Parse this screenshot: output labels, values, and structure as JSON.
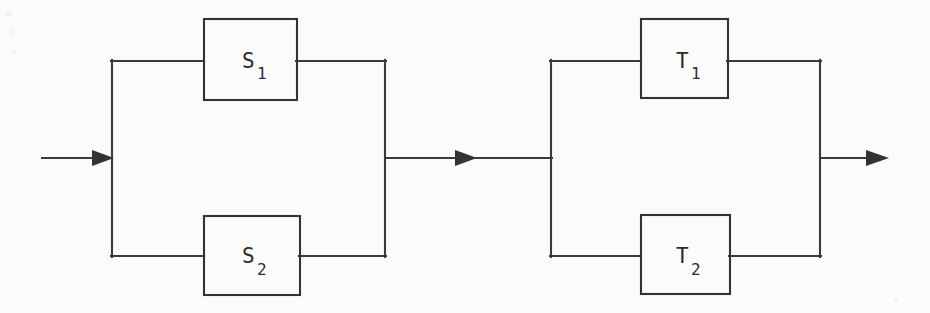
{
  "diagram": {
    "type": "reliability-block-diagram",
    "background_color": "#fbfbfa",
    "line_color": "#333333",
    "text_color": "#2b2b2b",
    "groups": [
      {
        "name": "left-parallel-group",
        "blocks": [
          {
            "id": "s1",
            "label": "S",
            "subscript": "1",
            "position": "top"
          },
          {
            "id": "s2",
            "label": "S",
            "subscript": "2",
            "position": "bottom"
          }
        ]
      },
      {
        "name": "right-parallel-group",
        "blocks": [
          {
            "id": "t1",
            "label": "T",
            "subscript": "1",
            "position": "top"
          },
          {
            "id": "t2",
            "label": "T",
            "subscript": "2",
            "position": "bottom"
          }
        ]
      }
    ],
    "connectors": [
      {
        "id": "input-arrow",
        "name": "input-arrow",
        "direction": "right"
      },
      {
        "id": "middle-arrow",
        "name": "middle-connector-arrow",
        "direction": "right"
      },
      {
        "id": "output-arrow",
        "name": "output-arrow",
        "direction": "right"
      }
    ]
  },
  "blocks": {
    "s1": {
      "label": "S",
      "subscript": "1"
    },
    "s2": {
      "label": "S",
      "subscript": "2"
    },
    "t1": {
      "label": "T",
      "subscript": "1"
    },
    "t2": {
      "label": "T",
      "subscript": "2"
    }
  }
}
